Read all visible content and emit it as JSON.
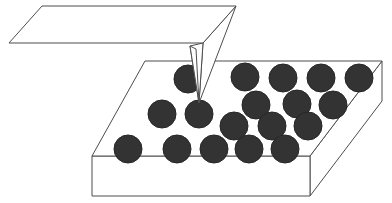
{
  "figure": {
    "caption": "",
    "background_color": "#ffffff",
    "line_color": "#4d4d4d",
    "face_color": "#ffffff",
    "particle_color": "#333333",
    "particle_stroke": "#262626",
    "stroke_width": 1
  },
  "cantilever": {
    "name": "cantilever-beam",
    "shape": "parallelogram",
    "fill": "#ffffff",
    "stroke": "#4d4d4d",
    "points": "42,6 236,6 203,43 9,43"
  },
  "tip": {
    "name": "pyramidal-probe-tip",
    "fill": "#ffffff",
    "stroke": "#4d4d4d",
    "apex": {
      "x": 199,
      "y": 103
    },
    "faces": [
      {
        "name": "tip-face-right",
        "points": "236,6 203,43 199,103"
      },
      {
        "name": "tip-face-left",
        "points": "203,43 190,46 199,103"
      },
      {
        "name": "tip-face-front",
        "points": "190,46 196,49 199,103"
      }
    ]
  },
  "substrate": {
    "name": "substrate-block",
    "fill": "#ffffff",
    "stroke": "#4d4d4d",
    "top_face": {
      "name": "substrate-top-face",
      "points": "145,61 382,61 310,156 92,156"
    },
    "front_face": {
      "name": "substrate-front-face",
      "points": "92,156 310,156 310,196 92,196"
    },
    "right_face": {
      "name": "substrate-right-face",
      "points": "310,156 382,61 382,101 310,196"
    }
  },
  "particles": {
    "name": "nanoparticle-array",
    "radius": 14,
    "count": 18,
    "color": "#333333",
    "rows": [
      {
        "row_label": "row-1-back",
        "items": [
          {
            "cx": 188,
            "cy": 79
          },
          {
            "cx": 245,
            "cy": 77
          },
          {
            "cx": 283,
            "cy": 78
          },
          {
            "cx": 321,
            "cy": 78
          },
          {
            "cx": 359,
            "cy": 78
          }
        ]
      },
      {
        "row_label": "row-2",
        "items": [
          {
            "cx": 162,
            "cy": 114
          },
          {
            "cx": 199,
            "cy": 114
          },
          {
            "cx": 256,
            "cy": 105
          },
          {
            "cx": 297,
            "cy": 104
          },
          {
            "cx": 333,
            "cy": 105
          }
        ]
      },
      {
        "row_label": "row-3",
        "items": [
          {
            "cx": 234,
            "cy": 126
          },
          {
            "cx": 272,
            "cy": 126
          },
          {
            "cx": 308,
            "cy": 126
          }
        ]
      },
      {
        "row_label": "row-4-front",
        "items": [
          {
            "cx": 128,
            "cy": 149
          },
          {
            "cx": 177,
            "cy": 149
          },
          {
            "cx": 214,
            "cy": 149
          },
          {
            "cx": 249,
            "cy": 149
          },
          {
            "cx": 285,
            "cy": 149
          }
        ]
      }
    ]
  }
}
